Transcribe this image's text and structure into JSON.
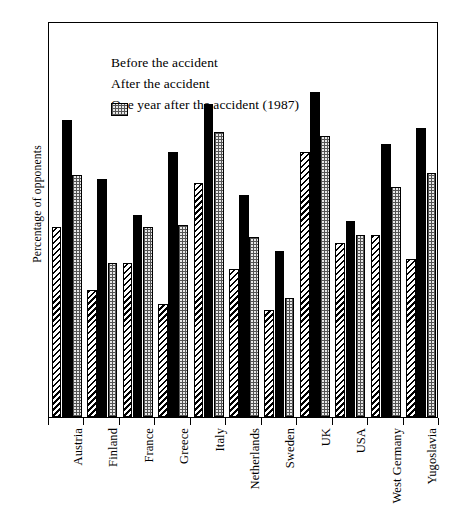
{
  "chart_data": {
    "type": "bar",
    "title": "",
    "xlabel": "",
    "ylabel": "Percentage of opponents",
    "ylim": [
      0,
      100
    ],
    "yticks": [
      0,
      10,
      20,
      30,
      40,
      50,
      60,
      70,
      80,
      90,
      100
    ],
    "grid": false,
    "legend_position": "top-left",
    "categories": [
      "Austria",
      "Finland",
      "France",
      "Greece",
      "Italy",
      "Netherlands",
      "Sweden",
      "UK",
      "USA",
      "West Germany",
      "Yugoslavia"
    ],
    "series": [
      {
        "name": "Before the accident",
        "pattern": "diagonal-hatch",
        "values": [
          48,
          32,
          39,
          28.5,
          59,
          37.5,
          27,
          67,
          44,
          46,
          40
        ]
      },
      {
        "name": "After the accident",
        "pattern": "solid-black",
        "values": [
          75,
          60,
          51,
          67,
          79,
          56,
          42,
          82,
          49.5,
          69,
          73
        ]
      },
      {
        "name": "One year after the accident (1987)",
        "pattern": "dotted-grid",
        "values": [
          61,
          39,
          48,
          48.5,
          72,
          45.5,
          30,
          71,
          46,
          58,
          61.5
        ]
      }
    ]
  },
  "legend": {
    "items": [
      {
        "label": "Before the accident"
      },
      {
        "label": "After the accident"
      },
      {
        "label": "One year after the accident (1987)"
      }
    ]
  },
  "colors": {
    "axis": "#000000",
    "before": "#ffffff",
    "after": "#000000",
    "oneyear": "#e8e8e8"
  }
}
